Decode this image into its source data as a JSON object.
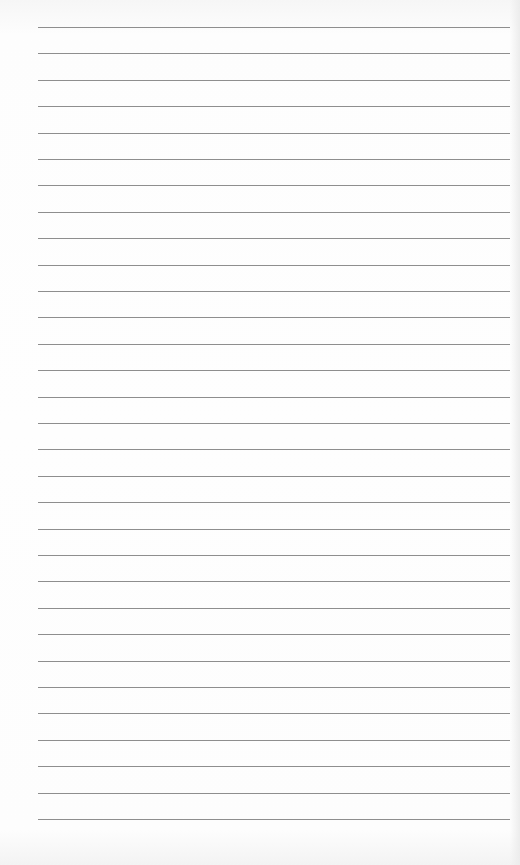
{
  "paper": {
    "type": "lined-notebook-page",
    "line_count": 31,
    "first_line_y": 27,
    "line_spacing": 26.4,
    "line_left": 38,
    "line_right": 510,
    "line_color": "#7a7a7a",
    "background_color": "#fdfdfd",
    "text": ""
  }
}
